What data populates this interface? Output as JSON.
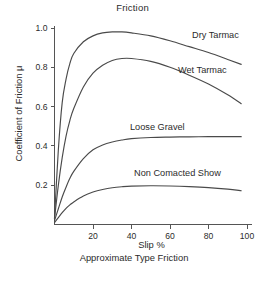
{
  "chart_data": {
    "type": "line",
    "title": "Friction",
    "xlabel": "Slip %",
    "caption": "Approximate Type Friction",
    "ylabel": "Coefficient of Friction μ",
    "xlim": [
      0,
      100
    ],
    "ylim": [
      0,
      1.0
    ],
    "grid": false,
    "legend_position": "inline-right",
    "xticks": [
      20,
      40,
      60,
      80,
      100
    ],
    "xtick_labels": [
      "20",
      "40",
      "60",
      "80",
      "100"
    ],
    "yticks": [
      0.2,
      0.4,
      0.6,
      0.8,
      1.0
    ],
    "ytick_labels": [
      "0.2",
      "0.4",
      "0.6",
      "0.8",
      "1.0"
    ],
    "x": [
      0,
      2,
      4,
      6,
      8,
      10,
      15,
      20,
      25,
      30,
      35,
      40,
      50,
      60,
      70,
      80,
      90,
      97
    ],
    "series": [
      {
        "name": "Dry Tarmac",
        "label": "Dry Tarmac",
        "values": [
          0.03,
          0.38,
          0.62,
          0.74,
          0.82,
          0.87,
          0.93,
          0.96,
          0.975,
          0.98,
          0.98,
          0.975,
          0.96,
          0.935,
          0.905,
          0.875,
          0.84,
          0.815
        ]
      },
      {
        "name": "Wet Tarmac",
        "label": "Wet Tarmac",
        "values": [
          0.03,
          0.2,
          0.34,
          0.45,
          0.53,
          0.59,
          0.7,
          0.77,
          0.81,
          0.835,
          0.845,
          0.845,
          0.83,
          0.8,
          0.76,
          0.715,
          0.66,
          0.615
        ]
      },
      {
        "name": "Loose Gravel",
        "label": "Loose Gravel",
        "values": [
          0.02,
          0.08,
          0.14,
          0.19,
          0.235,
          0.27,
          0.335,
          0.38,
          0.405,
          0.42,
          0.43,
          0.437,
          0.443,
          0.445,
          0.446,
          0.447,
          0.447,
          0.447
        ]
      },
      {
        "name": "Non Comacted Show",
        "label": "Non Comacted Show",
        "values": [
          0.01,
          0.035,
          0.06,
          0.082,
          0.1,
          0.115,
          0.145,
          0.165,
          0.178,
          0.187,
          0.192,
          0.195,
          0.197,
          0.196,
          0.193,
          0.188,
          0.18,
          0.172
        ]
      }
    ],
    "colors": {
      "curve": "#4a4a4a",
      "axis": "#555555",
      "text": "#2b2b2b",
      "background": "#ffffff"
    }
  }
}
